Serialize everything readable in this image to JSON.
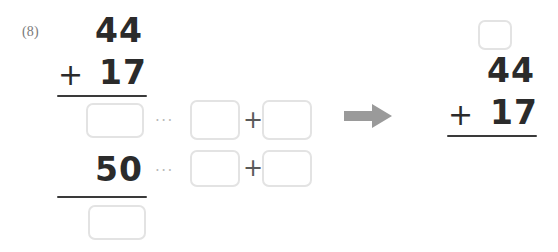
{
  "worksheet": {
    "problem_label": "(8)",
    "colors": {
      "ink": "#2b2b2b",
      "box_border": "#e3e3e3",
      "rule": "#3a3a3a",
      "arrow": "#9a9a9a",
      "dots": "#b9b9b9",
      "label": "#7a7a7a",
      "background": "#ffffff"
    }
  },
  "left_problem": {
    "name": "vertical-addition-with-decomposition",
    "addend_top": "44",
    "operator": "+",
    "addend_bottom": "17",
    "partial_sum_row": {
      "answer_box": "",
      "ellipsis": "···",
      "decomp_left_box": "",
      "decomp_plus": "+",
      "decomp_right_box": ""
    },
    "tens_row": {
      "value": "50",
      "ellipsis": "···",
      "decomp_left_box": "",
      "decomp_plus": "+",
      "decomp_right_box": ""
    },
    "total_box": ""
  },
  "arrow": {
    "name": "right-arrow",
    "direction": "right"
  },
  "right_problem": {
    "name": "vertical-addition-with-carry",
    "carry_box": "",
    "addend_top": "44",
    "operator": "+",
    "addend_bottom": "17"
  }
}
